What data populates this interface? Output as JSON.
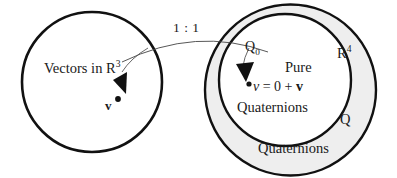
{
  "figure": {
    "colors": {
      "stroke": "#111111",
      "shading": "#eeeeee",
      "background": "#ffffff",
      "text": "#1a1a1a"
    },
    "left_set": {
      "name": "vectors-in-r3-circle",
      "label_main": "Vectors in R",
      "label_exponent": "3",
      "element_label": "v",
      "center": {
        "x": 92,
        "y": 82
      },
      "radius": 70
    },
    "mapping": {
      "label": "1 : 1",
      "description": "one-to-one correspondence arrow"
    },
    "right_set": {
      "name": "quaternions-circle",
      "outer_label_bottom": "Quaternions",
      "outer_label_r4_main": "R",
      "outer_label_r4_exponent": "4",
      "outer_label_q": "Q",
      "outer_center": {
        "x": 290,
        "y": 90
      },
      "outer_radius": 86,
      "inner": {
        "name": "pure-quaternions-circle",
        "label_q0_main": "Q",
        "label_q0_subscript": "0",
        "label_line1": "Pure",
        "label_line2": "Quaternions",
        "formula_italic_v": "v",
        "formula_rest": " = 0 + ",
        "formula_bold_v": "v",
        "inner_center": {
          "x": 285,
          "y": 80
        },
        "inner_radius": 67
      }
    }
  }
}
